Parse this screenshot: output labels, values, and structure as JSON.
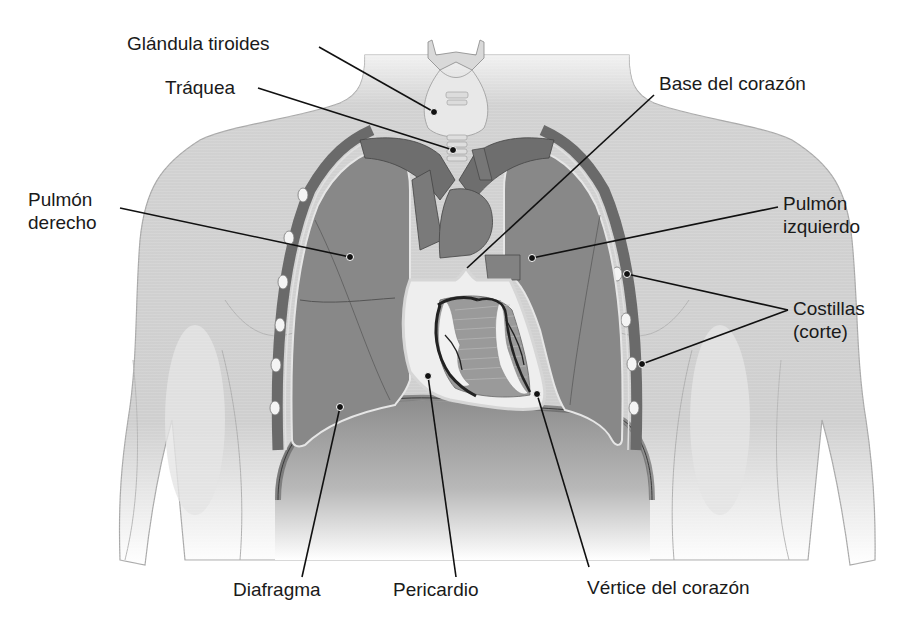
{
  "diagram": {
    "type": "anatomical-illustration",
    "colors": {
      "background": "#ffffff",
      "skin": "#d6d6d6",
      "skin_outline": "#a8a8a8",
      "lung": "#8a8a8a",
      "lung_dark": "#747474",
      "vessel": "#6e6e6e",
      "pleura_outline": "#e8e8e8",
      "pericardium": "#efefef",
      "heart_muscle": "#9a9a9a",
      "fat": "#f2f2f2",
      "coronary": "#2a2a2a",
      "rib_cut": "#f4f4f4",
      "leader_line": "#111111",
      "text": "#1a1a1a"
    },
    "labels": {
      "thyroid": "Glándula tiroides",
      "trachea": "Tráquea",
      "heart_base": "Base del corazón",
      "right_lung_1": "Pulmón",
      "right_lung_2": "derecho",
      "left_lung_1": "Pulmón",
      "left_lung_2": "izquierdo",
      "ribs_1": "Costillas",
      "ribs_2": "(corte)",
      "diaphragm": "Diafragma",
      "pericardium": "Pericardio",
      "heart_apex": "Vértice del corazón"
    }
  }
}
